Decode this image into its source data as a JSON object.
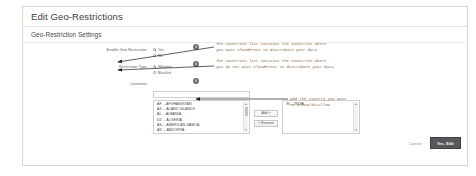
{
  "dialog": {
    "title": "Edit Geo-Restrictions",
    "section_title": "Geo-Restriction Settings"
  },
  "form": {
    "enable": {
      "label": "Enable Geo-Restriction",
      "options": [
        {
          "label": "Yes",
          "checked": true
        },
        {
          "label": "No",
          "checked": false
        }
      ]
    },
    "restriction_type": {
      "label": "Restriction Type",
      "options": [
        {
          "label": "Whitelist",
          "checked": true
        },
        {
          "label": "Blacklist",
          "checked": false
        }
      ]
    },
    "countries": {
      "label": "Countries",
      "filter_placeholder": "",
      "filter_value": "",
      "available": [
        "AF -- AFGHANISTAN",
        "AX -- ALAND ISLANDS",
        "AL -- ALBANIA",
        "DZ -- ALGERIA",
        "AS -- AMERICAN SAMOA",
        "AD -- ANDORRA"
      ],
      "selected": [
        "IN -- INDIA"
      ],
      "add_label": "Add »",
      "remove_label": "« Remove"
    }
  },
  "info_icons": {
    "enable": "i",
    "restriction_type": "i",
    "countries": "i"
  },
  "footer": {
    "cancel_label": "Cancel",
    "submit_label": "Yes, Edit"
  },
  "annotations": [
    {
      "id": "whitelist-note",
      "text": "The countries list contains the countries where\nyou want CloudFront to distribute your data"
    },
    {
      "id": "blacklist-note",
      "text": "The countries list contains the countries where\nyou do not want CloudFront to distribute your data"
    },
    {
      "id": "add-note",
      "text": "Add the country you want\nto allow/disallow"
    }
  ],
  "colors": {
    "annotation": "#8a6a4a",
    "primary_button": "#58585a",
    "panel_border": "#d8d8d8"
  }
}
